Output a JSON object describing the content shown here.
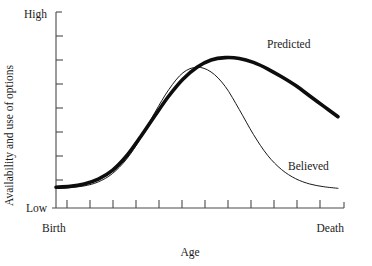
{
  "chart_data": {
    "type": "line",
    "title": "",
    "subtitle": "",
    "xlabel": "Age",
    "ylabel": "Availability and use of options",
    "x_tick_labels": [
      "Birth",
      "Death"
    ],
    "y_tick_labels": [
      "Low",
      "High"
    ],
    "xlim": [
      "Birth",
      "Death"
    ],
    "ylim": [
      "Low",
      "High"
    ],
    "grid": false,
    "legend_position": "inline-annotation",
    "x_axis_tick_count": 13,
    "y_axis_tick_count": 8,
    "annotations": [
      {
        "text": "Predicted",
        "x": 0.8,
        "y": 0.83
      },
      {
        "text": "Believed",
        "x": 0.83,
        "y": 0.22
      }
    ],
    "series": [
      {
        "name": "Predicted",
        "style": "thick",
        "color": "#0d0d0d",
        "x": [
          0.0,
          0.05,
          0.1,
          0.15,
          0.2,
          0.25,
          0.3,
          0.35,
          0.4,
          0.45,
          0.5,
          0.55,
          0.6,
          0.65,
          0.7,
          0.75,
          0.8,
          0.85,
          0.9,
          0.95,
          1.0
        ],
        "y": [
          0.055,
          0.06,
          0.075,
          0.105,
          0.16,
          0.25,
          0.37,
          0.5,
          0.625,
          0.73,
          0.805,
          0.85,
          0.865,
          0.86,
          0.835,
          0.795,
          0.745,
          0.69,
          0.625,
          0.56,
          0.495
        ]
      },
      {
        "name": "Believed",
        "style": "thin",
        "color": "#1a1a1a",
        "x": [
          0.0,
          0.05,
          0.1,
          0.15,
          0.2,
          0.25,
          0.3,
          0.35,
          0.4,
          0.45,
          0.5,
          0.55,
          0.6,
          0.65,
          0.7,
          0.75,
          0.8,
          0.85,
          0.9,
          0.95,
          1.0
        ],
        "y": [
          0.05,
          0.053,
          0.063,
          0.088,
          0.14,
          0.23,
          0.36,
          0.52,
          0.665,
          0.77,
          0.805,
          0.775,
          0.685,
          0.54,
          0.385,
          0.255,
          0.165,
          0.108,
          0.075,
          0.058,
          0.048
        ]
      }
    ]
  }
}
